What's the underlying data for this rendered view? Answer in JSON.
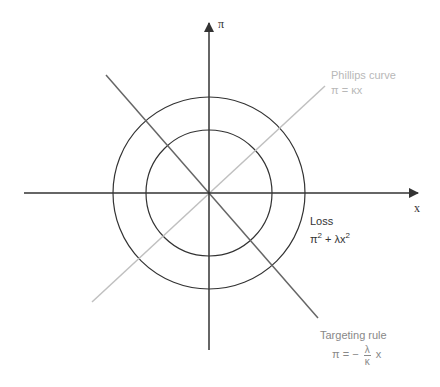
{
  "axes": {
    "x_label": "x",
    "y_label": "π"
  },
  "phillips_curve": {
    "title": "Phillips curve",
    "equation": "π = κx",
    "color": "#c0c0c0"
  },
  "loss": {
    "title": "Loss",
    "eq_pi": "π",
    "eq_sq1": "2",
    "eq_mid": " + λx",
    "eq_sq2": "2",
    "color": "#333333"
  },
  "targeting_rule": {
    "title": "Targeting rule",
    "eq_lhs": "π = −",
    "frac_num": "λ",
    "frac_den": "κ",
    "eq_rhs": "x",
    "color": "#777777"
  },
  "circles": {
    "count": 2,
    "description": "iso-loss contours"
  }
}
